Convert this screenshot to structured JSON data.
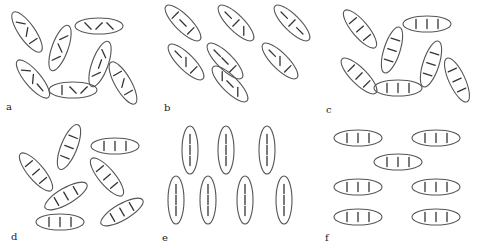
{
  "figure": {
    "panels": [
      {
        "label": "a",
        "molecules": [
          {
            "cx": 27,
            "cy": 32,
            "angle": -55,
            "ticks": [
              "slant-l",
              "slant-r",
              "vertical"
            ]
          },
          {
            "cx": 60,
            "cy": 48,
            "angle": 70,
            "ticks": [
              "slant-r",
              "slant-l",
              "slant-r"
            ]
          },
          {
            "cx": 99,
            "cy": 26,
            "angle": 0,
            "ticks": [
              "slant-r",
              "slant-l",
              "slant-r"
            ]
          },
          {
            "cx": 33,
            "cy": 79,
            "angle": -50,
            "ticks": [
              "slant-l",
              "slant-r",
              "horizontal"
            ]
          },
          {
            "cx": 100,
            "cy": 64,
            "angle": 70,
            "ticks": [
              "slant-r",
              "horizontal",
              "slant-l"
            ]
          },
          {
            "cx": 73,
            "cy": 90,
            "angle": 0,
            "ticks": [
              "vertical",
              "slant-r",
              "slant-l"
            ]
          },
          {
            "cx": 123,
            "cy": 83,
            "angle": -60,
            "ticks": [
              "vertical",
              "slant-r",
              "vertical"
            ]
          }
        ]
      },
      {
        "label": "b",
        "molecules": [
          {
            "cx": 183,
            "cy": 23,
            "angle": -45,
            "ticks": [
              "vertical",
              "horizontal",
              "vertical"
            ]
          },
          {
            "cx": 236,
            "cy": 23,
            "angle": -45,
            "ticks": [
              "horizontal",
              "vertical",
              "slant-r"
            ]
          },
          {
            "cx": 292,
            "cy": 23,
            "angle": -45,
            "ticks": [
              "horizontal",
              "vertical",
              "horizontal"
            ]
          },
          {
            "cx": 186,
            "cy": 62,
            "angle": -45,
            "ticks": [
              "horizontal",
              "slant-r",
              "vertical"
            ]
          },
          {
            "cx": 225,
            "cy": 61,
            "angle": -45,
            "ticks": [
              "horizontal",
              "horizontal",
              "vertical"
            ]
          },
          {
            "cx": 280,
            "cy": 61,
            "angle": -45,
            "ticks": [
              "horizontal",
              "slant-r",
              "vertical"
            ]
          },
          {
            "cx": 230,
            "cy": 84,
            "angle": -45,
            "ticks": [
              "slant-r",
              "horizontal",
              "slant-r"
            ]
          }
        ]
      },
      {
        "label": "c",
        "molecules": [
          {
            "cx": 360,
            "cy": 29,
            "angle": -50,
            "ticks": [
              "uniform",
              "uniform",
              "uniform"
            ]
          },
          {
            "cx": 427,
            "cy": 24,
            "angle": 0,
            "ticks": [
              "uniform",
              "uniform",
              "uniform"
            ]
          },
          {
            "cx": 392,
            "cy": 50,
            "angle": 72,
            "ticks": [
              "uniform",
              "uniform",
              "uniform"
            ]
          },
          {
            "cx": 431,
            "cy": 64,
            "angle": 72,
            "ticks": [
              "uniform",
              "uniform",
              "uniform"
            ]
          },
          {
            "cx": 359,
            "cy": 76,
            "angle": -45,
            "ticks": [
              "uniform",
              "uniform",
              "uniform"
            ]
          },
          {
            "cx": 398,
            "cy": 88,
            "angle": 0,
            "ticks": [
              "uniform",
              "uniform",
              "uniform"
            ]
          },
          {
            "cx": 457,
            "cy": 80,
            "angle": -65,
            "ticks": [
              "uniform",
              "uniform",
              "uniform"
            ]
          }
        ]
      },
      {
        "label": "d",
        "molecules": [
          {
            "cx": 69,
            "cy": 147,
            "angle": 68,
            "ticks": [
              "vertical",
              "vertical",
              "vertical"
            ]
          },
          {
            "cx": 115,
            "cy": 146,
            "angle": 0,
            "ticks": [
              "vertical",
              "vertical",
              "vertical"
            ]
          },
          {
            "cx": 36,
            "cy": 172,
            "angle": -50,
            "ticks": [
              "vertical",
              "vertical",
              "vertical"
            ]
          },
          {
            "cx": 107,
            "cy": 177,
            "angle": -50,
            "ticks": [
              "vertical",
              "vertical",
              "vertical"
            ]
          },
          {
            "cx": 66,
            "cy": 196,
            "angle": 30,
            "ticks": [
              "vertical",
              "vertical",
              "vertical"
            ]
          },
          {
            "cx": 122,
            "cy": 212,
            "angle": 30,
            "ticks": [
              "vertical",
              "vertical",
              "vertical"
            ]
          },
          {
            "cx": 60,
            "cy": 222,
            "angle": 0,
            "ticks": [
              "vertical",
              "vertical",
              "vertical"
            ]
          }
        ]
      },
      {
        "label": "e",
        "molecules": [
          {
            "cx": 190,
            "cy": 150,
            "angle": 90,
            "ticks": [
              "axial",
              "axial",
              "axial"
            ]
          },
          {
            "cx": 226,
            "cy": 150,
            "angle": 90,
            "ticks": [
              "axial",
              "axial",
              "axial"
            ]
          },
          {
            "cx": 267,
            "cy": 150,
            "angle": 90,
            "ticks": [
              "axial",
              "axial",
              "axial"
            ]
          },
          {
            "cx": 176,
            "cy": 200,
            "angle": 90,
            "ticks": [
              "axial",
              "axial",
              "axial"
            ]
          },
          {
            "cx": 208,
            "cy": 200,
            "angle": 90,
            "ticks": [
              "axial",
              "axial",
              "axial"
            ]
          },
          {
            "cx": 245,
            "cy": 200,
            "angle": 90,
            "ticks": [
              "axial",
              "axial",
              "axial"
            ]
          },
          {
            "cx": 284,
            "cy": 200,
            "angle": 90,
            "ticks": [
              "axial",
              "axial",
              "axial"
            ]
          }
        ]
      },
      {
        "label": "f",
        "molecules": [
          {
            "cx": 358,
            "cy": 138,
            "angle": 0,
            "ticks": [
              "vertical",
              "vertical",
              "vertical"
            ]
          },
          {
            "cx": 436,
            "cy": 138,
            "angle": 0,
            "ticks": [
              "vertical",
              "vertical",
              "vertical"
            ]
          },
          {
            "cx": 398,
            "cy": 162,
            "angle": 0,
            "ticks": [
              "vertical",
              "vertical",
              "vertical"
            ]
          },
          {
            "cx": 358,
            "cy": 187,
            "angle": 0,
            "ticks": [
              "vertical",
              "vertical",
              "vertical"
            ]
          },
          {
            "cx": 436,
            "cy": 187,
            "angle": 0,
            "ticks": [
              "vertical",
              "vertical",
              "vertical"
            ]
          },
          {
            "cx": 358,
            "cy": 217,
            "angle": 0,
            "ticks": [
              "vertical",
              "vertical",
              "vertical"
            ]
          },
          {
            "cx": 436,
            "cy": 217,
            "angle": 0,
            "ticks": [
              "vertical",
              "vertical",
              "vertical"
            ]
          }
        ]
      }
    ]
  }
}
